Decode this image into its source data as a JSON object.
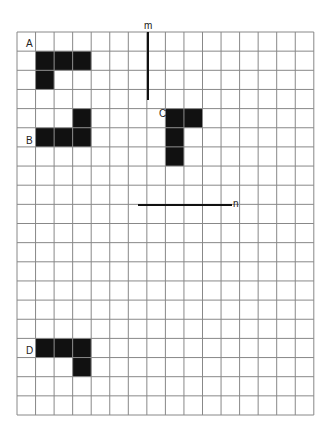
{
  "grid": {
    "left": 17,
    "top": 32,
    "cols": 16,
    "rows": 20,
    "cell_w": 18.55,
    "cell_h": 19.15,
    "line_color": "#888888",
    "fill_color": "#111111"
  },
  "shapes": [
    {
      "label": "A",
      "label_pos": [
        26,
        49
      ],
      "cells": [
        [
          1,
          1
        ],
        [
          2,
          1
        ],
        [
          3,
          1
        ],
        [
          1,
          2
        ]
      ]
    },
    {
      "label": "B",
      "label_pos": [
        26,
        146
      ],
      "cells": [
        [
          3,
          4
        ],
        [
          1,
          5
        ],
        [
          2,
          5
        ],
        [
          3,
          5
        ]
      ]
    },
    {
      "label": "C",
      "label_pos": [
        159,
        119
      ],
      "cells": [
        [
          8,
          4
        ],
        [
          9,
          4
        ],
        [
          8,
          5
        ],
        [
          8,
          6
        ]
      ]
    },
    {
      "label": "D",
      "label_pos": [
        26,
        356
      ],
      "cells": [
        [
          1,
          16
        ],
        [
          2,
          16
        ],
        [
          3,
          16
        ],
        [
          3,
          17
        ]
      ]
    }
  ],
  "lines": [
    {
      "label": "m",
      "x1": 148,
      "y1": 32,
      "x2": 148,
      "y2": 100,
      "label_pos": [
        144,
        31
      ]
    },
    {
      "label": "n",
      "x1": 138,
      "y1": 205,
      "x2": 232,
      "y2": 205,
      "label_pos": [
        233,
        209
      ]
    }
  ]
}
